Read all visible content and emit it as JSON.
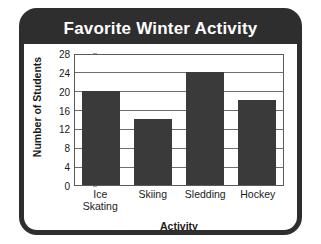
{
  "card": {
    "frame_color": "#2e2e2e",
    "background_color": "#ffffff"
  },
  "chart_data": {
    "type": "bar",
    "title": "Favorite Winter Activity",
    "xlabel": "Activity",
    "ylabel": "Number of Students",
    "categories": [
      "Ice Skating",
      "Skiing",
      "Sledding",
      "Hockey"
    ],
    "category_lines": [
      [
        "Ice",
        "Skating"
      ],
      [
        "Skiing"
      ],
      [
        "Sledding"
      ],
      [
        "Hockey"
      ]
    ],
    "values": [
      20,
      14,
      24,
      18
    ],
    "ylim": [
      0,
      28
    ],
    "ytick_step": 4,
    "yticks": [
      0,
      4,
      8,
      12,
      16,
      20,
      24,
      28
    ],
    "ytick_labels": [
      "0",
      "4",
      "8",
      "12",
      "16",
      "20",
      "24",
      "28"
    ],
    "grid": true,
    "legend": false,
    "bar_color": "#3a3a3a",
    "title_text_color": "#ffffff",
    "axis_text_color": "#1a1a1a"
  }
}
